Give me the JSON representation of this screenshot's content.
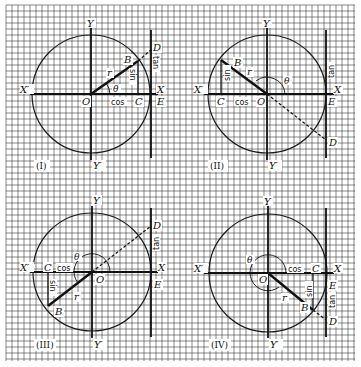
{
  "figure": {
    "grid": {
      "x0": 6,
      "y0": 5,
      "x1": 355,
      "y1": 361,
      "step": 6,
      "color": "#3a3a3a"
    },
    "line_color": "#1a1a1a"
  },
  "panels": [
    {
      "id": "I",
      "label": "(I)",
      "origin": [
        91,
        94
      ],
      "radius": 59,
      "tangent_x": 151,
      "B": [
        138,
        61
      ],
      "C": [
        138,
        94
      ],
      "D": [
        152,
        49
      ],
      "dashed_to": null,
      "theta_arc": "small",
      "labels": {
        "Y": "Y",
        "Y_prime": "Y′",
        "X": "X",
        "X_prime": "X′",
        "O": "O",
        "B": "B",
        "C": "C",
        "D": "D",
        "E": "E",
        "r": "r",
        "theta": "θ",
        "sin": "sin",
        "cos": "cos",
        "tan": "tan"
      }
    },
    {
      "id": "II",
      "label": "(II)",
      "origin": [
        267,
        94
      ],
      "radius": 59,
      "tangent_x": 326,
      "B": [
        221,
        60
      ],
      "C": [
        221,
        94
      ],
      "D": [
        326,
        140
      ],
      "theta_arc": "large",
      "labels": {
        "Y": "Y",
        "Y_prime": "Y′",
        "X": "X",
        "X_prime": "X′",
        "O": "O",
        "B": "B",
        "C": "C",
        "D": "D",
        "E": "E",
        "r": "r",
        "theta": "θ",
        "sin": "sin",
        "cos": "cos",
        "tan": "tan"
      }
    },
    {
      "id": "III",
      "label": "(III)",
      "origin": [
        92,
        272
      ],
      "radius": 59,
      "tangent_x": 151,
      "B": [
        48,
        306
      ],
      "C": [
        48,
        272
      ],
      "D": [
        151,
        226
      ],
      "theta_arc": "large",
      "labels": {
        "Y": "Y",
        "Y_prime": "Y′",
        "X": "X",
        "X_prime": "X′",
        "O": "O",
        "B": "B",
        "C": "C",
        "D": "D",
        "E": "E",
        "r": "r",
        "theta": "θ",
        "sin": "sin",
        "cos": "cos",
        "tan": "tan"
      }
    },
    {
      "id": "IV",
      "label": "(IV)",
      "origin": [
        268,
        273
      ],
      "radius": 59,
      "tangent_x": 326,
      "B": [
        313,
        310
      ],
      "C": [
        313,
        273
      ],
      "D": [
        326,
        320
      ],
      "theta_arc": "large",
      "labels": {
        "Y": "Y",
        "Y_prime": "Y′",
        "X": "X",
        "X_prime": "X′",
        "O": "O",
        "B": "B",
        "C": "C",
        "D": "D",
        "E": "E",
        "r": "r",
        "theta": "θ",
        "sin": "sin",
        "cos": "cos",
        "tan": "tan"
      }
    }
  ]
}
